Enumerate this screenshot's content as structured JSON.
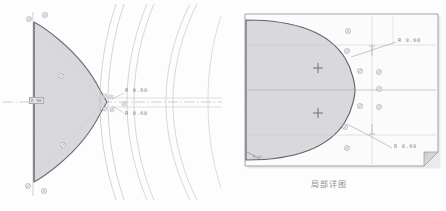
{
  "document": {
    "type": "engineering-drawing",
    "background_color": "#fdfdfd",
    "ink_color": "#6f6f76",
    "fill_color": "#d9d9dc",
    "accent_color": "#9a9aa2"
  },
  "left_view": {
    "name": "main-section-view",
    "axis_tag": "E 50",
    "dimensions": [
      {
        "id": "r-upper",
        "label": "R 0.60"
      },
      {
        "id": "r-lower",
        "label": "R 0.60"
      }
    ],
    "node_marker_count": 6,
    "arc_group_count": 3
  },
  "detail_view": {
    "name": "local-detail-view",
    "caption": "局部详图",
    "corner_tag": "0.15",
    "dimensions": [
      {
        "id": "detail-r-upper",
        "label": "R 0.60"
      },
      {
        "id": "detail-r-lower",
        "label": "R 0.60"
      }
    ],
    "center_markers": 2,
    "node_marker_count": 10
  }
}
